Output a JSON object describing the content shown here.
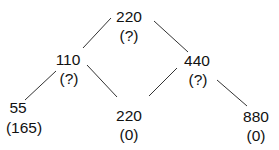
{
  "diagram": {
    "type": "tree",
    "nodes": [
      {
        "id": "root",
        "value": "220",
        "annotation": "(?)"
      },
      {
        "id": "left",
        "value": "110",
        "annotation": "(?)"
      },
      {
        "id": "right",
        "value": "440",
        "annotation": "(?)"
      },
      {
        "id": "left-left",
        "value": "55",
        "annotation": "(165)"
      },
      {
        "id": "middle",
        "value": "220",
        "annotation": "(0)"
      },
      {
        "id": "right-right",
        "value": "880",
        "annotation": "(0)"
      }
    ],
    "edges": [
      {
        "from": "root",
        "to": "left"
      },
      {
        "from": "root",
        "to": "right"
      },
      {
        "from": "left",
        "to": "left-left"
      },
      {
        "from": "left",
        "to": "middle"
      },
      {
        "from": "right",
        "to": "middle"
      },
      {
        "from": "right",
        "to": "right-right"
      }
    ]
  }
}
